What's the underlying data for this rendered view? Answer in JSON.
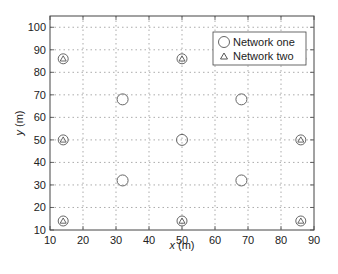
{
  "chart_data": {
    "type": "scatter",
    "title": "",
    "xlabel": "x (m)",
    "ylabel": "y (m)",
    "xlim": [
      10,
      90
    ],
    "ylim": [
      10,
      105
    ],
    "xticks": [
      10,
      20,
      30,
      40,
      50,
      60,
      70,
      80,
      90
    ],
    "yticks": [
      10,
      20,
      30,
      40,
      50,
      60,
      70,
      80,
      90,
      100
    ],
    "grid": true,
    "legend_position": "upper right",
    "series": [
      {
        "name": "Network one",
        "marker": "circle",
        "color": "#666666",
        "points": [
          [
            32,
            68
          ],
          [
            68,
            68
          ],
          [
            50,
            50
          ],
          [
            32,
            32
          ],
          [
            68,
            32
          ]
        ]
      },
      {
        "name": "Network two",
        "marker": "triangle-in-circle",
        "color": "#666666",
        "points": [
          [
            14,
            86
          ],
          [
            50,
            86
          ],
          [
            86,
            86
          ],
          [
            14,
            50
          ],
          [
            86,
            50
          ],
          [
            14,
            14
          ],
          [
            50,
            14
          ],
          [
            86,
            14
          ]
        ]
      }
    ]
  },
  "legend": {
    "items": [
      {
        "label": "Network one",
        "marker": "circle"
      },
      {
        "label": "Network two",
        "marker": "triangle"
      }
    ]
  },
  "axes": {
    "xlabel_var": "x",
    "xlabel_unit": " (m)",
    "ylabel_var": "y",
    "ylabel_unit": " (m)"
  }
}
